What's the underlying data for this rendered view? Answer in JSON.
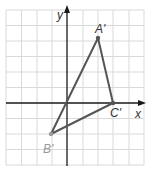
{
  "diagram": {
    "type": "coordinate-plane-triangle",
    "axes": {
      "x_label": "x",
      "y_label": "y"
    },
    "grid": {
      "x_min": -4,
      "x_max": 5,
      "y_min": -4,
      "y_max": 6,
      "spacing_px": 15.5
    },
    "colors": {
      "grid": "#d9d9d9",
      "axis": "#1a1a1a",
      "triangle": "#555555",
      "label": "#333333",
      "label_light": "#999999"
    },
    "points": [
      {
        "name": "A'",
        "x": 2,
        "y": 4
      },
      {
        "name": "B'",
        "x": -1,
        "y": -2
      },
      {
        "name": "C'",
        "x": 3,
        "y": 0
      }
    ]
  }
}
